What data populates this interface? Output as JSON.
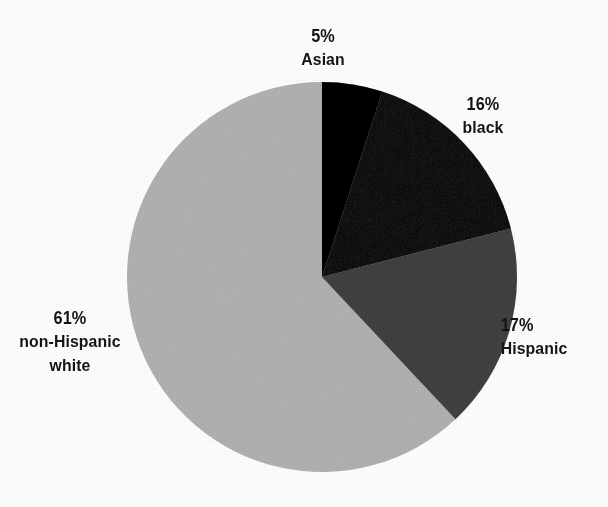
{
  "chart_data": {
    "type": "pie",
    "title": "",
    "subtitle": "",
    "xlabel": "",
    "ylabel": "",
    "legend_position": "none",
    "grid": false,
    "units": "percent",
    "start_angle_deg": 0,
    "direction": "clockwise",
    "center": {
      "x": 322,
      "y": 277,
      "radius": 195
    },
    "categories": [
      "Asian",
      "black",
      "Hispanic",
      "non-Hispanic white"
    ],
    "values": [
      5,
      16,
      17,
      61
    ],
    "slices": [
      {
        "id": "asian",
        "label": "Asian",
        "percent_text": "5%",
        "value": 5,
        "color": "#1a1a1a",
        "start_deg": 0,
        "end_deg": 18
      },
      {
        "id": "black",
        "label": "black",
        "percent_text": "16%",
        "value": 16,
        "color": "#464646",
        "start_deg": 18,
        "end_deg": 75.6
      },
      {
        "id": "hispanic",
        "label": "Hispanic",
        "percent_text": "17%",
        "value": 17,
        "color": "#808080",
        "start_deg": 75.6,
        "end_deg": 136.8
      },
      {
        "id": "non-hispanic-white",
        "label_line1": "non-Hispanic",
        "label_line2": "white",
        "label": "non-Hispanic white",
        "percent_text": "61%",
        "value": 61,
        "color": "#d6d6d6",
        "start_deg": 136.8,
        "end_deg": 360
      }
    ],
    "annotations": [
      {
        "id": "asian",
        "percent_text": "5%",
        "category_text": "Asian",
        "position": "top"
      },
      {
        "id": "black",
        "percent_text": "16%",
        "category_text": "black",
        "position": "upper-right"
      },
      {
        "id": "hispanic",
        "percent_text": "17%",
        "category_text": "Hispanic",
        "position": "right"
      },
      {
        "id": "white",
        "percent_text": "61%",
        "category_line1": "non-Hispanic",
        "category_line2": "white",
        "position": "left"
      }
    ]
  },
  "colors": {
    "background": "#ffffff",
    "text": "#141414",
    "asian": "#1a1a1a",
    "black": "#464646",
    "hispanic": "#808080",
    "non_hispanic_white": "#d6d6d6"
  }
}
